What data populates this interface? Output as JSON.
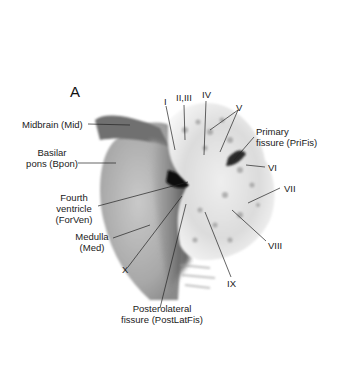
{
  "figure": {
    "panel_label": "A",
    "labels": {
      "midbrain": "Midbrain (Mid)",
      "basilar_pons_1": "Basilar",
      "basilar_pons_2": "pons (Bpon)",
      "fourth_ventricle_1": "Fourth",
      "fourth_ventricle_2": "ventricle",
      "fourth_ventricle_3": "(ForVen)",
      "medulla_1": "Medulla",
      "medulla_2": "(Med)",
      "lobule_x": "X",
      "posterolateral_1": "Posterolateral",
      "posterolateral_2": "fissure (PostLatFis)",
      "lobule_i": "I",
      "lobule_ii_iii": "II,III",
      "lobule_iv": "IV",
      "lobule_v": "V",
      "primary_fissure_1": "Primary",
      "primary_fissure_2": "fissure (PriFis)",
      "lobule_vi": "VI",
      "lobule_vii": "VII",
      "lobule_viii": "VIII",
      "lobule_ix": "IX"
    }
  }
}
